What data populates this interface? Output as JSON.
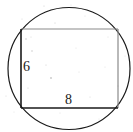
{
  "figure": {
    "canvas": {
      "width": 133,
      "height": 132,
      "background": "#ffffff"
    },
    "shapes": {
      "circle": {
        "name": "circumscribed-circle",
        "cx": 69,
        "cy": 68.5,
        "r": 61,
        "stroke": "#1a1a1a",
        "stroke_width": 1.2,
        "fill": "none"
      },
      "rectangle": {
        "name": "inscribed-rectangle",
        "x": 21,
        "y": 29,
        "width": 97,
        "height": 79,
        "fill": "none",
        "edges": {
          "top": {
            "stroke": "#8a8a8a",
            "stroke_width": 1.2
          },
          "right": {
            "stroke": "#8a8a8a",
            "stroke_width": 1.2
          },
          "bottom": {
            "stroke": "#1a1a1a",
            "stroke_width": 1.6
          },
          "left": {
            "stroke": "#1a1a1a",
            "stroke_width": 1.6
          }
        }
      }
    },
    "labels": {
      "height": {
        "text": "6",
        "x": 23,
        "y": 60
      },
      "width": {
        "text": "8",
        "x": 65,
        "y": 93
      }
    },
    "speckles": [
      {
        "x": 44,
        "y": 6,
        "r": 0.6,
        "o": 0.28
      },
      {
        "x": 71,
        "y": 5,
        "r": 0.5,
        "o": 0.22
      },
      {
        "x": 22,
        "y": 19,
        "r": 0.5,
        "o": 0.25
      },
      {
        "x": 55,
        "y": 23,
        "r": 0.6,
        "o": 0.3
      },
      {
        "x": 26,
        "y": 39,
        "r": 0.7,
        "o": 0.35
      },
      {
        "x": 31,
        "y": 37,
        "r": 0.5,
        "o": 0.25
      },
      {
        "x": 32,
        "y": 51,
        "r": 0.8,
        "o": 0.3
      },
      {
        "x": 76,
        "y": 48,
        "r": 0.5,
        "o": 0.22
      },
      {
        "x": 108,
        "y": 37,
        "r": 0.5,
        "o": 0.2
      },
      {
        "x": 46,
        "y": 65,
        "r": 0.6,
        "o": 0.28
      },
      {
        "x": 51,
        "y": 78,
        "r": 0.9,
        "o": 0.33
      },
      {
        "x": 79,
        "y": 72,
        "r": 0.5,
        "o": 0.2
      },
      {
        "x": 105,
        "y": 67,
        "r": 0.5,
        "o": 0.22
      },
      {
        "x": 28,
        "y": 88,
        "r": 0.6,
        "o": 0.25
      },
      {
        "x": 90,
        "y": 97,
        "r": 0.5,
        "o": 0.25
      },
      {
        "x": 6,
        "y": 96,
        "r": 0.6,
        "o": 0.22
      },
      {
        "x": 118,
        "y": 86,
        "r": 0.5,
        "o": 0.2
      },
      {
        "x": 60,
        "y": 113,
        "r": 0.5,
        "o": 0.2
      },
      {
        "x": 99,
        "y": 119,
        "r": 0.5,
        "o": 0.18
      },
      {
        "x": 14,
        "y": 112,
        "r": 0.5,
        "o": 0.18
      },
      {
        "x": 85,
        "y": 16,
        "r": 0.5,
        "o": 0.2
      },
      {
        "x": 125,
        "y": 56,
        "r": 0.5,
        "o": 0.18
      }
    ]
  }
}
